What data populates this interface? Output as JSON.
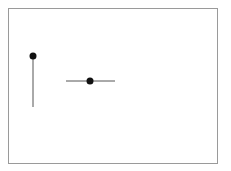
{
  "diagram": {
    "frame": {
      "x": 8,
      "y": 8,
      "width": 210,
      "height": 156,
      "stroke": "#9a9a9a",
      "fill": "#ffffff"
    },
    "elements": [
      {
        "name": "vertical-segment",
        "line": {
          "x1": 33,
          "y1": 56,
          "x2": 33,
          "y2": 107,
          "stroke": "#555555",
          "width": 1
        },
        "dot": {
          "cx": 33,
          "cy": 56,
          "r": 3.5,
          "fill": "#111111"
        },
        "dot_position": "top-end"
      },
      {
        "name": "horizontal-segment",
        "line": {
          "x1": 66,
          "y1": 81,
          "x2": 115,
          "y2": 81,
          "stroke": "#555555",
          "width": 1
        },
        "dot": {
          "cx": 90,
          "cy": 81,
          "r": 3.5,
          "fill": "#111111"
        },
        "dot_position": "midpoint"
      }
    ],
    "labels": []
  }
}
